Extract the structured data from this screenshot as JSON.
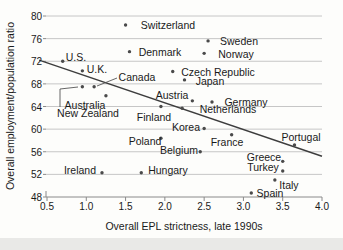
{
  "chart_data": {
    "type": "scatter",
    "title": "",
    "xlabel": "Overall EPL strictness, late 1990s",
    "ylabel": "Overall employment/population ratio",
    "xlim": [
      0.5,
      4.0
    ],
    "ylim": [
      48,
      80
    ],
    "x_ticks": [
      0.5,
      1.0,
      1.5,
      2.0,
      2.5,
      3.0,
      3.5,
      4.0
    ],
    "y_ticks": [
      48,
      52,
      56,
      60,
      64,
      68,
      72,
      76,
      80
    ],
    "grid": "horizontal-gridlines-on",
    "legend": "none",
    "trend_line": {
      "x1": 0.4,
      "y1": 72.2,
      "x2": 4.0,
      "y2": 55.2
    },
    "points": [
      {
        "label": "U.S.",
        "x": 0.7,
        "y": 72.0,
        "label_px": [
          76,
          57
        ]
      },
      {
        "label": "U.K.",
        "x": 0.95,
        "y": 70.3,
        "label_px": [
          97,
          69
        ]
      },
      {
        "label": "Canada",
        "x": 1.1,
        "y": 67.5,
        "label_px": [
          137,
          77
        ],
        "leader": [
          [
            117,
            78
          ],
          [
            97,
            86
          ]
        ]
      },
      {
        "label": "New Zealand",
        "x": 0.95,
        "y": 67.5,
        "label_px": [
          88,
          113
        ],
        "leader": [
          [
            60,
            107
          ],
          [
            60,
            89
          ],
          [
            78,
            87
          ]
        ]
      },
      {
        "label": "Australia",
        "x": 1.25,
        "y": 65.9,
        "label_px": [
          85,
          105
        ]
      },
      {
        "label": "Switzerland",
        "x": 1.5,
        "y": 78.4,
        "label_px": [
          168,
          25
        ]
      },
      {
        "label": "Denmark",
        "x": 1.55,
        "y": 73.7,
        "label_px": [
          160,
          52
        ]
      },
      {
        "label": "Sweden",
        "x": 2.55,
        "y": 75.6,
        "label_px": [
          239,
          41
        ]
      },
      {
        "label": "Norway",
        "x": 2.5,
        "y": 73.4,
        "label_px": [
          236,
          54
        ]
      },
      {
        "label": "Czech Republic",
        "x": 2.1,
        "y": 70.2,
        "label_px": [
          218,
          72
        ]
      },
      {
        "label": "Japan",
        "x": 2.25,
        "y": 68.7,
        "label_px": [
          210,
          81
        ]
      },
      {
        "label": "Austria",
        "x": 2.35,
        "y": 65.0,
        "label_px": [
          172,
          95
        ]
      },
      {
        "label": "Germany",
        "x": 2.6,
        "y": 64.8,
        "label_px": [
          246,
          102
        ]
      },
      {
        "label": "Netherlands",
        "x": 2.22,
        "y": 63.7,
        "label_px": [
          228,
          109
        ]
      },
      {
        "label": "Finland",
        "x": 1.95,
        "y": 64.0,
        "label_px": [
          154,
          117
        ]
      },
      {
        "label": "Korea",
        "x": 2.5,
        "y": 60.1,
        "label_px": [
          186,
          127
        ]
      },
      {
        "label": "Poland",
        "x": 1.95,
        "y": 58.4,
        "label_px": [
          145,
          141
        ]
      },
      {
        "label": "Belgium",
        "x": 2.45,
        "y": 56.0,
        "label_px": [
          179,
          150
        ]
      },
      {
        "label": "France",
        "x": 2.85,
        "y": 59.0,
        "label_px": [
          227,
          142
        ]
      },
      {
        "label": "Portugal",
        "x": 3.65,
        "y": 57.2,
        "label_px": [
          301,
          137
        ]
      },
      {
        "label": "Greece",
        "x": 3.5,
        "y": 54.3,
        "label_px": [
          264,
          157
        ]
      },
      {
        "label": "Turkey",
        "x": 3.5,
        "y": 52.6,
        "label_px": [
          263,
          167
        ]
      },
      {
        "label": "Italy",
        "x": 3.4,
        "y": 51.0,
        "label_px": [
          289,
          185
        ]
      },
      {
        "label": "Spain",
        "x": 3.1,
        "y": 48.7,
        "label_px": [
          270,
          193
        ]
      },
      {
        "label": "Ireland",
        "x": 1.2,
        "y": 52.3,
        "label_px": [
          80,
          170
        ]
      },
      {
        "label": "Hungary",
        "x": 1.7,
        "y": 52.3,
        "label_px": [
          168,
          170
        ]
      }
    ]
  },
  "colors": {
    "background": "#fdfdfb",
    "bottom_strip": "#e9e9e7",
    "gridline": "#c6c6c6",
    "axis": "#8a8a8a",
    "dot": "#4a4a4a",
    "trend_line": "#3d3d3d",
    "leader": "#555555",
    "text": "#1a1a1a"
  }
}
